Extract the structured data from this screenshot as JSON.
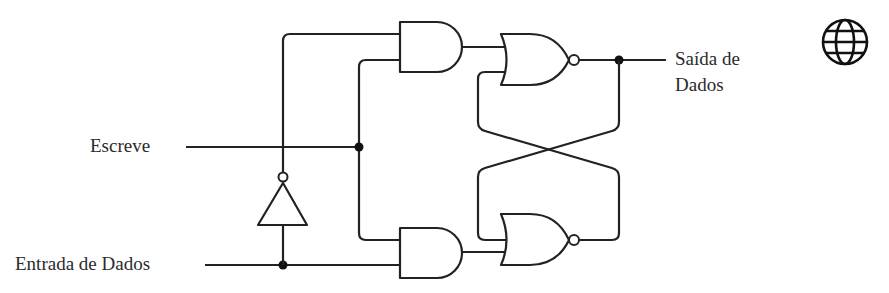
{
  "diagram": {
    "labels": {
      "write": "Escreve",
      "data_in": "Entrada de Dados",
      "data_out_line1": "Saída de",
      "data_out_line2": "Dados"
    },
    "components": [
      {
        "type": "NOT",
        "name": "inverter",
        "input": "Entrada de Dados",
        "output": "AND superior (entrada 1)"
      },
      {
        "type": "AND",
        "name": "and-top",
        "inputs": [
          "NOT(Entrada de Dados)",
          "Escreve"
        ],
        "output": "NOR superior"
      },
      {
        "type": "AND",
        "name": "and-bottom",
        "inputs": [
          "Escreve",
          "Entrada de Dados"
        ],
        "output": "NOR inferior"
      },
      {
        "type": "NOR",
        "name": "nor-top",
        "inputs": [
          "AND superior",
          "NOR inferior (realimentação)"
        ],
        "output": "Saída de Dados"
      },
      {
        "type": "NOR",
        "name": "nor-bottom",
        "inputs": [
          "NOR superior (realimentação)",
          "AND inferior"
        ],
        "output": "NOR superior"
      }
    ],
    "junctions": 3,
    "colors": {
      "line": "#222222",
      "text": "#2b2b2b",
      "background": "#ffffff"
    },
    "icon": "globe-icon"
  }
}
